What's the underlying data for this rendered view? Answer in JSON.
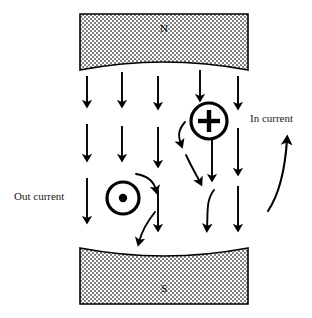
{
  "figure": {
    "width": 312,
    "height": 318,
    "background": "#ffffff",
    "ink_color": "#000000"
  },
  "magnets": {
    "north": {
      "letter": "N",
      "label": "north-pole",
      "x": 80,
      "y": 14,
      "width": 168,
      "height": 56,
      "curve_depth": 16,
      "fill_pattern": "stipple-dots",
      "fill_color": "#d8d8d8",
      "border_color": "#000000"
    },
    "south": {
      "letter": "S",
      "label": "south-pole",
      "x": 80,
      "y": 248,
      "width": 168,
      "height": 56,
      "curve_depth": 16,
      "fill_pattern": "stipple-dots",
      "fill_color": "#d8d8d8",
      "border_color": "#000000"
    }
  },
  "charges": {
    "positive": {
      "symbol": "+",
      "name": "positive-charge-marker",
      "meaning": "In current",
      "cx": 209,
      "cy": 121,
      "r": 19,
      "stroke_width": 3.2
    },
    "out_of_page": {
      "symbol": "⊙",
      "name": "current-out-of-page-marker",
      "meaning": "Out current",
      "cx": 123,
      "cy": 198,
      "r": 17,
      "dot_r": 4,
      "stroke_width": 3.2
    }
  },
  "labels": {
    "out_current": {
      "text": "Out current",
      "x": 14,
      "y": 196
    },
    "in_current": {
      "text": "In current",
      "x": 250,
      "y": 122
    }
  },
  "field_lines": {
    "direction": "downward, north to south",
    "straight_arrows": [
      {
        "x": 87,
        "y1": 76,
        "y2": 104
      },
      {
        "x": 87,
        "y1": 124,
        "y2": 158
      },
      {
        "x": 87,
        "y1": 178,
        "y2": 220
      },
      {
        "x": 122,
        "y1": 72,
        "y2": 104
      },
      {
        "x": 122,
        "y1": 126,
        "y2": 158
      },
      {
        "x": 158,
        "y1": 76,
        "y2": 106
      },
      {
        "x": 158,
        "y1": 127,
        "y2": 164
      },
      {
        "x": 158,
        "y1": 190,
        "y2": 228
      },
      {
        "x": 200,
        "y1": 70,
        "y2": 98
      },
      {
        "x": 212,
        "y1": 140,
        "y2": 178
      },
      {
        "x": 238,
        "y1": 76,
        "y2": 106
      },
      {
        "x": 238,
        "y1": 128,
        "y2": 172
      },
      {
        "x": 238,
        "y1": 186,
        "y2": 228
      }
    ],
    "curved_arrows": [
      {
        "name": "deflected-left-of-plus-upper",
        "path": "M 185 122 C 178 130, 178 136, 181 144"
      },
      {
        "name": "deflected-left-of-plus-lower",
        "path": "M 186 155 C 192 168, 196 174, 200 182"
      },
      {
        "name": "deflected-above-dot-circle",
        "path": "M 136 174 C 149 176, 154 182, 156 190"
      },
      {
        "name": "deflected-below-dot-circle",
        "path": "M 155 212 C 147 222, 142 230, 139 242"
      },
      {
        "name": "s-curve-right-lower",
        "path": "M 214 190 C 206 200, 208 212, 207 228"
      }
    ],
    "lead_arrow": {
      "name": "in-current-lead-arrow",
      "path": "M 268 211 C 278 196, 285 170, 287 140"
    }
  }
}
